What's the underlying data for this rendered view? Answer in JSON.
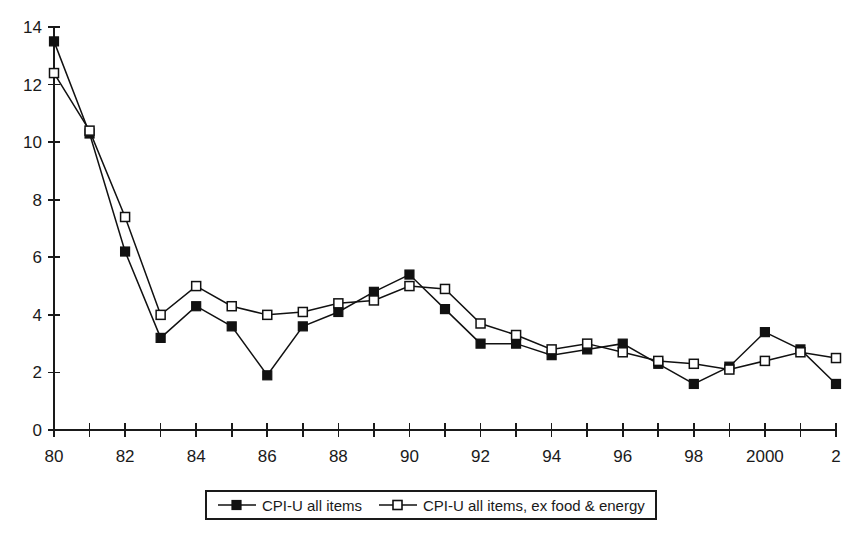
{
  "chart_data": {
    "type": "line",
    "title": "",
    "subtitle": "",
    "xlabel": "",
    "ylabel": "",
    "grid": false,
    "legend_position": "bottom",
    "x": [
      1980,
      1981,
      1982,
      1983,
      1984,
      1985,
      1986,
      1987,
      1988,
      1989,
      1990,
      1991,
      1992,
      1993,
      1994,
      1995,
      1996,
      1997,
      1998,
      1999,
      2000,
      2001,
      2002
    ],
    "categories": [
      "80",
      "81",
      "82",
      "83",
      "84",
      "85",
      "86",
      "87",
      "88",
      "89",
      "90",
      "91",
      "92",
      "93",
      "94",
      "95",
      "96",
      "97",
      "98",
      "99",
      "2000",
      "01",
      "2"
    ],
    "xtick_labels": [
      "80",
      "82",
      "84",
      "86",
      "88",
      "90",
      "92",
      "94",
      "96",
      "98",
      "2000",
      "2"
    ],
    "xtick_values": [
      1980,
      1982,
      1984,
      1986,
      1988,
      1990,
      1992,
      1994,
      1996,
      1998,
      2000,
      2002
    ],
    "ytick_labels": [
      "0",
      "2",
      "4",
      "6",
      "8",
      "10",
      "12",
      "14"
    ],
    "ytick_values": [
      0,
      2,
      4,
      6,
      8,
      10,
      12,
      14
    ],
    "xlim": [
      1980,
      2002
    ],
    "ylim": [
      0,
      14
    ],
    "series": [
      {
        "name": "CPI-U all items",
        "marker": "filled-square",
        "values": [
          13.5,
          10.3,
          6.2,
          3.2,
          4.3,
          3.6,
          1.9,
          3.6,
          4.1,
          4.8,
          5.4,
          4.2,
          3.0,
          3.0,
          2.6,
          2.8,
          3.0,
          2.3,
          1.6,
          2.2,
          3.4,
          2.8,
          1.6
        ]
      },
      {
        "name": "CPI-U all items, ex food & energy",
        "marker": "open-square",
        "values": [
          12.4,
          10.4,
          7.4,
          4.0,
          5.0,
          4.3,
          4.0,
          4.1,
          4.4,
          4.5,
          5.0,
          4.9,
          3.7,
          3.3,
          2.8,
          3.0,
          2.7,
          2.4,
          2.3,
          2.1,
          2.4,
          2.7,
          2.5
        ]
      }
    ]
  },
  "legend": {
    "entries": [
      {
        "label": "CPI-U all items",
        "marker": "filled-square"
      },
      {
        "label": "CPI-U all items, ex food & energy",
        "marker": "open-square"
      }
    ]
  },
  "colors": {
    "line": "#111111",
    "marker_fill": "#111111",
    "marker_open_fill": "#ffffff",
    "axis": "#1a1a1a",
    "background": "#ffffff"
  }
}
